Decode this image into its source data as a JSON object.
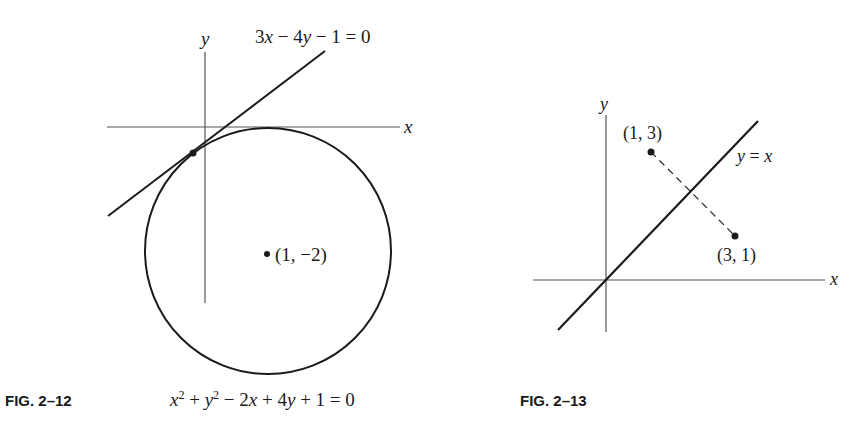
{
  "figures": [
    {
      "caption": "FIG. 2–12",
      "axis_labels": {
        "x": "x",
        "y": "y"
      },
      "line_equation": {
        "parts": [
          "3",
          "x",
          " − 4",
          "y",
          " − 1 = 0"
        ]
      },
      "circle_equation": {
        "parts": [
          "x",
          "2",
          " + ",
          "y",
          "2",
          " − 2",
          "x",
          " + 4",
          "y",
          " + 1 = 0"
        ]
      },
      "center_label": "(1, −2)",
      "elements": [
        "circle",
        "tangent-line",
        "tangent-point",
        "center-point",
        "x-axis",
        "y-axis"
      ]
    },
    {
      "caption": "FIG. 2–13",
      "axis_labels": {
        "x": "x",
        "y": "y"
      },
      "line_label": {
        "parts": [
          "y",
          " = ",
          "x"
        ]
      },
      "point_a_label": "(1, 3)",
      "point_b_label": "(3, 1)",
      "elements": [
        "line-y-equals-x",
        "point-1-3",
        "point-3-1",
        "dashed-segment",
        "x-axis",
        "y-axis"
      ]
    }
  ],
  "colors": {
    "ink": "#1a1a1a",
    "axis": "#555555",
    "background": "#ffffff"
  }
}
